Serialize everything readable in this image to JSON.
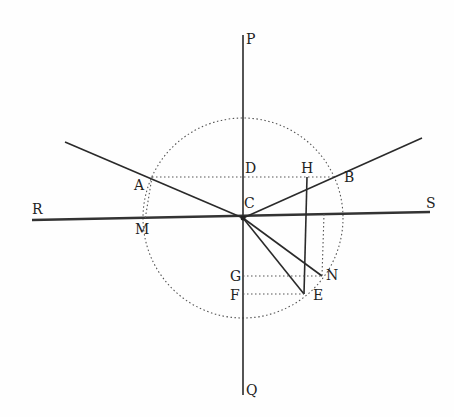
{
  "figure": {
    "type": "geometric optics diagram (refraction / reflection construction)",
    "labels": {
      "P": "P",
      "Q": "Q",
      "R": "R",
      "S": "S",
      "A": "A",
      "B": "B",
      "C": "C",
      "D": "D",
      "H": "H",
      "M": "M",
      "G": "G",
      "F": "F",
      "E": "E",
      "N": "N"
    },
    "colors": {
      "ink": "#2a2a2a",
      "dotted": "#555555",
      "paper": "#fefefe"
    }
  }
}
